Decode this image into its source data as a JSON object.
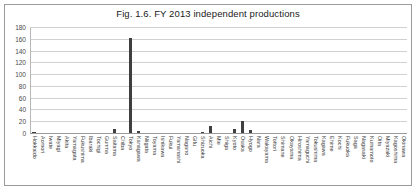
{
  "chart_data": {
    "type": "bar",
    "title": "Fig. 1.6. FY 2013 independent productions",
    "xlabel": "",
    "ylabel": "",
    "ylim": [
      0,
      180
    ],
    "yticks": [
      0,
      20,
      40,
      60,
      80,
      100,
      120,
      140,
      160,
      180
    ],
    "grid": true,
    "legend": "none",
    "bar_color": "#3f3f3f",
    "categories": [
      "Hokkaido",
      "Aomori",
      "Iwate",
      "Miyagi",
      "Akita",
      "Yamagata",
      "Fukushima",
      "Ibaraki",
      "Tochigi",
      "Gunma",
      "Saitama",
      "Chiba",
      "Tokyo",
      "Kanagawa",
      "Niigata",
      "Toyama",
      "Ishikawa",
      "Fukui",
      "Yamanashi",
      "Nagano",
      "Gifu",
      "Shizuoka",
      "Aichi",
      "Mie",
      "Shiga",
      "Kyoto",
      "Osaka",
      "Hyogo",
      "Nara",
      "Wakayama",
      "Tottori",
      "Shimane",
      "Okayama",
      "Hiroshima",
      "Yamaguchi",
      "Tokushima",
      "Kagawa",
      "Ehime",
      "Kochi",
      "Fukuoka",
      "Saga",
      "Nagasaki",
      "Kumamoto",
      "Oita",
      "Miyazaki",
      "Kagoshima",
      "Okinawa"
    ],
    "values": [
      3,
      0,
      0,
      1,
      0,
      0,
      2,
      0,
      0,
      1,
      8,
      2,
      163,
      5,
      1,
      0,
      0,
      0,
      0,
      1,
      0,
      3,
      13,
      0,
      1,
      9,
      22,
      7,
      1,
      0,
      0,
      0,
      1,
      2,
      0,
      0,
      0,
      0,
      0,
      2,
      0,
      0,
      0,
      0,
      0,
      0,
      1
    ]
  }
}
